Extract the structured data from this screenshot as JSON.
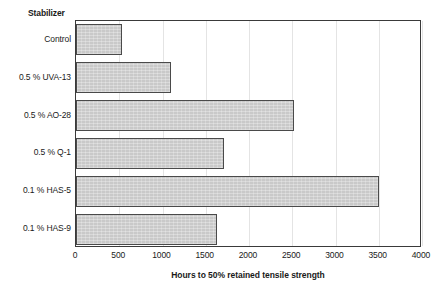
{
  "chart_data": {
    "type": "bar",
    "orientation": "horizontal",
    "title": "",
    "category_header": "Stabilizer",
    "categories": [
      "Control",
      "0.5 % UVA-13",
      "0.5 % AO-28",
      "0.5 % Q-1",
      "0.1 % HAS-5",
      "0.1 % HAS-9"
    ],
    "values": [
      530,
      1100,
      2520,
      1710,
      3500,
      1630
    ],
    "xlabel": "Hours to 50% retained tensile strength",
    "ylabel": "Stabilizer",
    "xlim": [
      0,
      4000
    ],
    "xticks": [
      0,
      500,
      1000,
      1500,
      2000,
      2500,
      3000,
      3500,
      4000
    ],
    "xtick_labels": [
      "0",
      "500",
      "1000",
      "1500",
      "2000",
      "2500",
      "3000",
      "3500",
      "4000"
    ],
    "grid": "vertical",
    "legend": "none",
    "bar_fill_color": "#c9c9c9",
    "bar_edge_color": "#4a4a4a",
    "gridline_color": "#e4e4e4",
    "frame_color": "#3a3a3a"
  }
}
